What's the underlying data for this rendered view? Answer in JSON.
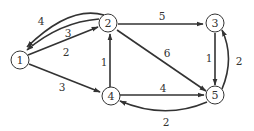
{
  "graph": {
    "nodes": [
      {
        "id": "1",
        "label": "1"
      },
      {
        "id": "2",
        "label": "2"
      },
      {
        "id": "3",
        "label": "3"
      },
      {
        "id": "4",
        "label": "4"
      },
      {
        "id": "5",
        "label": "5"
      }
    ],
    "edges": [
      {
        "from": "1",
        "to": "2",
        "weight": "2"
      },
      {
        "from": "2",
        "to": "1",
        "weight": "3"
      },
      {
        "from": "2",
        "to": "1",
        "weight": "4"
      },
      {
        "from": "1",
        "to": "4",
        "weight": "3"
      },
      {
        "from": "4",
        "to": "2",
        "weight": "1"
      },
      {
        "from": "2",
        "to": "3",
        "weight": "5"
      },
      {
        "from": "2",
        "to": "5",
        "weight": "6"
      },
      {
        "from": "3",
        "to": "5",
        "weight": "1"
      },
      {
        "from": "5",
        "to": "3",
        "weight": "2"
      },
      {
        "from": "4",
        "to": "5",
        "weight": "4"
      },
      {
        "from": "5",
        "to": "4",
        "weight": "2"
      }
    ]
  }
}
